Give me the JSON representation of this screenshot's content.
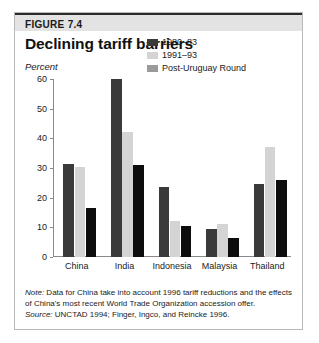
{
  "figure": {
    "number": "FIGURE 7.4",
    "title": "Declining tariff barriers",
    "unit_label": "Percent",
    "note_lead": "Note:",
    "note_text": " Data for China take into account 1996 tariff reductions and the effects of China's most recent World Trade Organization accession offer.",
    "source_lead": "Source:",
    "source_text": " UNCTAD 1994; Finger, Ingco, and Reincke 1996."
  },
  "colors": {
    "series_1980_83": "#3a3a3a",
    "series_1991_93": "#d4d4d4",
    "series_post_uruguay": "#0d0d0d",
    "legend_post_uruguay": "#9a9a9a",
    "axis": "#8a8a8a",
    "header_band": "#e3e3e3",
    "frame_border": "#b9b9b9"
  },
  "chart_data": {
    "type": "bar",
    "title": "Declining tariff barriers",
    "subtitle": "",
    "xlabel": "",
    "ylabel": "Percent",
    "ylim": [
      0,
      60
    ],
    "yticks": [
      0,
      10,
      20,
      30,
      40,
      50,
      60
    ],
    "grid": false,
    "legend_position": "top-right",
    "categories": [
      "China",
      "India",
      "Indonesia",
      "Malaysia",
      "Thailand"
    ],
    "series": [
      {
        "name": "1980–83",
        "values": [
          31.5,
          60,
          23.5,
          9.5,
          24.5
        ]
      },
      {
        "name": "1991–93",
        "values": [
          30.5,
          42,
          12,
          11,
          37
        ]
      },
      {
        "name": "Post-Uruguay Round",
        "values": [
          16.5,
          31,
          10.5,
          6.5,
          26
        ]
      }
    ]
  }
}
